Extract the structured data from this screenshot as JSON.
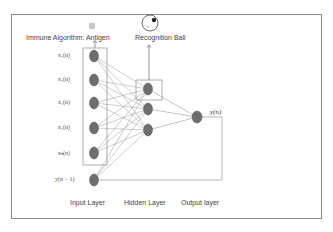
{
  "diagram": {
    "type": "neural-network-with-immune-algorithm",
    "top_labels": {
      "antigen_label": "Immune Algorithm:  Antigen",
      "recognition_label": "Recognition Ball"
    },
    "input_nodes": [
      {
        "label": "x₁(n)"
      },
      {
        "label": "x₂(n)"
      },
      {
        "label": "x₃(n)"
      },
      {
        "label": "x₄(n)"
      },
      {
        "label": "xₙ(n)"
      },
      {
        "label": "y(n − 1)"
      }
    ],
    "hidden_nodes": 3,
    "output_label": "y(n)",
    "layer_labels": {
      "input": "Input Layer",
      "hidden": "Hidden Layer",
      "output": "Output layer"
    },
    "colors": {
      "node_fill": "#6e6e6e",
      "node_stroke": "#555555",
      "edge": "#9a9a9a",
      "box": "#8a8a8a",
      "antigen_icon": "#c8c8c8"
    }
  }
}
